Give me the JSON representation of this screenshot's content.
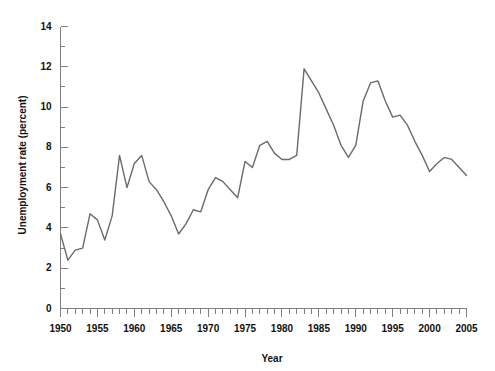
{
  "chart_data": {
    "type": "line",
    "title": "",
    "xlabel": "Year",
    "ylabel": "Unemployment rate (percent)",
    "xlim": [
      1950,
      2005
    ],
    "ylim": [
      0,
      14
    ],
    "grid": false,
    "legend": "none",
    "line_color": "#6a6a6a",
    "axis_color": "#808080",
    "text_color": "#111111",
    "y_ticks": [
      0,
      2,
      4,
      6,
      8,
      10,
      12,
      14
    ],
    "y_tick_labels": [
      "0",
      "2",
      "4",
      "6",
      "8",
      "10",
      "12",
      "14"
    ],
    "y_minor_tick_step": 1,
    "x_ticks": [
      1950,
      1955,
      1960,
      1965,
      1970,
      1975,
      1980,
      1985,
      1990,
      1995,
      2000,
      2005
    ],
    "x_tick_labels": [
      "1950",
      "1955",
      "1960",
      "1965",
      "1970",
      "1975",
      "1980",
      "1985",
      "1990",
      "1995",
      "2000",
      "2005"
    ],
    "x_minor_tick_step": 1,
    "x": [
      1950,
      1951,
      1952,
      1953,
      1954,
      1955,
      1956,
      1957,
      1958,
      1959,
      1960,
      1961,
      1962,
      1963,
      1964,
      1965,
      1966,
      1967,
      1968,
      1969,
      1970,
      1971,
      1972,
      1973,
      1974,
      1975,
      1976,
      1977,
      1978,
      1979,
      1980,
      1981,
      1982,
      1983,
      1984,
      1985,
      1986,
      1987,
      1988,
      1989,
      1990,
      1991,
      1992,
      1993,
      1994,
      1995,
      1996,
      1997,
      1998,
      1999,
      2000,
      2001,
      2002,
      2003,
      2004,
      2005
    ],
    "values": [
      3.7,
      2.4,
      2.9,
      3.0,
      4.7,
      4.4,
      3.4,
      4.6,
      7.6,
      6.0,
      7.2,
      7.6,
      6.3,
      5.9,
      5.3,
      4.6,
      3.7,
      4.2,
      4.9,
      4.8,
      5.9,
      6.5,
      6.3,
      5.9,
      5.5,
      7.3,
      7.0,
      8.1,
      8.3,
      7.7,
      7.4,
      7.4,
      7.6,
      11.9,
      11.3,
      10.7,
      9.9,
      9.1,
      8.1,
      7.5,
      8.1,
      10.3,
      11.2,
      11.3,
      10.3,
      9.5,
      9.6,
      9.1,
      8.3,
      7.6,
      6.8,
      7.2,
      7.5,
      7.4,
      7.0,
      6.6
    ],
    "annotations": []
  },
  "axis": {
    "y_title": "Unemployment rate (percent)",
    "x_title": "Year"
  }
}
